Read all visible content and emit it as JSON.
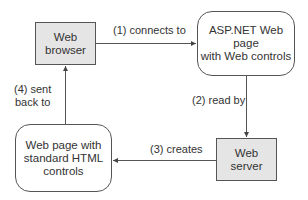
{
  "diagram": {
    "nodes": [
      {
        "id": "web_browser",
        "label_line1": "Web",
        "label_line2": "browser",
        "shape": "rectangle",
        "fill": "#e5e5e5"
      },
      {
        "id": "aspnet_page",
        "label_line1": "ASP.NET Web page",
        "label_line2": "with Web controls",
        "shape": "rounded",
        "fill": "#ffffff"
      },
      {
        "id": "web_server",
        "label_line1": "Web",
        "label_line2": "server",
        "shape": "rectangle",
        "fill": "#e5e5e5"
      },
      {
        "id": "html_page",
        "label_line1": "Web page with",
        "label_line2": "standard HTML",
        "label_line3": "controls",
        "shape": "rounded",
        "fill": "#ffffff"
      }
    ],
    "edges": [
      {
        "from": "web_browser",
        "to": "aspnet_page",
        "label": "(1) connects to"
      },
      {
        "from": "aspnet_page",
        "to": "web_server",
        "label": "(2) read by"
      },
      {
        "from": "web_server",
        "to": "html_page",
        "label": "(3) creates"
      },
      {
        "from": "html_page",
        "to": "web_browser",
        "label_line1": "(4) sent",
        "label_line2": "back to"
      }
    ]
  }
}
